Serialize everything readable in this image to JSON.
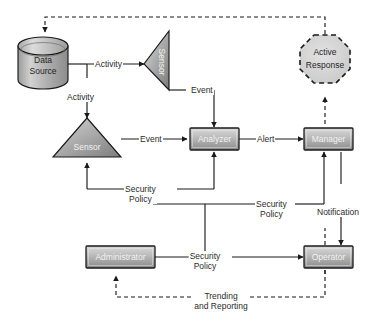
{
  "diagram": {
    "background_color": "#ffffff",
    "stroke_color": "#1a1a1a",
    "node_fill_light": "#cfcfcf",
    "node_fill_dark": "#8d8d8d",
    "text_color": "#1f1f1f",
    "highlight_text_color": "#f2f2f2"
  },
  "nodes": {
    "data_source": {
      "label_line1": "Data",
      "label_line2": "Source",
      "shape": "cylinder"
    },
    "sensor_top": {
      "label": "Sensor",
      "shape": "triangle-left"
    },
    "sensor_left": {
      "label": "Sensor",
      "shape": "triangle-up"
    },
    "analyzer": {
      "label": "Analyzer",
      "shape": "rectangle"
    },
    "manager": {
      "label": "Manager",
      "shape": "rectangle"
    },
    "active_response": {
      "label_line1": "Active",
      "label_line2": "Response",
      "shape": "dashed-octagon"
    },
    "administrator": {
      "label": "Administrator",
      "shape": "rectangle"
    },
    "operator": {
      "label": "Operator",
      "shape": "rectangle"
    }
  },
  "edge_labels": {
    "activity_to_sensor_top": "Activity",
    "activity_to_sensor_left": "Activity",
    "event_from_sensor_top": "Event",
    "event_from_sensor_left": "Event",
    "alert": "Alert",
    "security_policy_sensor": {
      "line1": "Security",
      "line2": "Policy"
    },
    "security_policy_manager": {
      "line1": "Security",
      "line2": "Policy"
    },
    "security_policy_admin": {
      "line1": "Security",
      "line2": "Policy"
    },
    "notification": "Notification",
    "trending": {
      "line1": "Trending",
      "line2": "and Reporting"
    }
  }
}
